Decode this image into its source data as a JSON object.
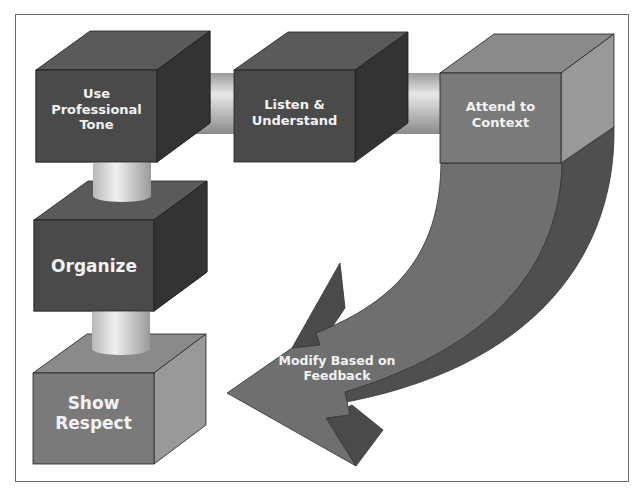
{
  "diagram": {
    "type": "process-flow",
    "steps": [
      {
        "id": "use-professional-tone",
        "label": "Use Professional Tone",
        "lines": [
          "Use",
          "Professional",
          "Tone"
        ],
        "shape": "cube",
        "shade": "#4a4a4a"
      },
      {
        "id": "listen-understand",
        "label": "Listen & Understand",
        "lines": [
          "Listen &",
          "Understand"
        ],
        "shape": "cube",
        "shade": "#4a4a4a"
      },
      {
        "id": "attend-to-context",
        "label": "Attend to Context",
        "lines": [
          "Attend to",
          "Context"
        ],
        "shape": "cube",
        "shade": "#7a7a7a"
      },
      {
        "id": "modify-based-on-feedback",
        "label": "Modify Based on Feedback",
        "lines": [
          "Modify Based on",
          "Feedback"
        ],
        "shape": "curved-arrow",
        "shade": "#6f6f6f"
      },
      {
        "id": "organize",
        "label": "Organize",
        "lines": [
          "Organize"
        ],
        "shape": "cube",
        "shade": "#4a4a4a"
      },
      {
        "id": "show-respect",
        "label": "Show Respect",
        "lines": [
          "Show",
          "Respect"
        ],
        "shape": "cube",
        "shade": "#7a7a7a"
      }
    ],
    "connectors": [
      {
        "from": "use-professional-tone",
        "to": "listen-understand",
        "shape": "cylinder"
      },
      {
        "from": "listen-understand",
        "to": "attend-to-context",
        "shape": "cylinder"
      },
      {
        "from": "use-professional-tone",
        "to": "organize",
        "shape": "cylinder"
      },
      {
        "from": "organize",
        "to": "show-respect",
        "shape": "cylinder"
      }
    ],
    "colors": {
      "dark_box": "#4a4a4a",
      "light_box": "#7a7a7a",
      "arrow": "#6f6f6f",
      "text": "#f2f2f2",
      "frame": "#6a6a6a"
    }
  }
}
